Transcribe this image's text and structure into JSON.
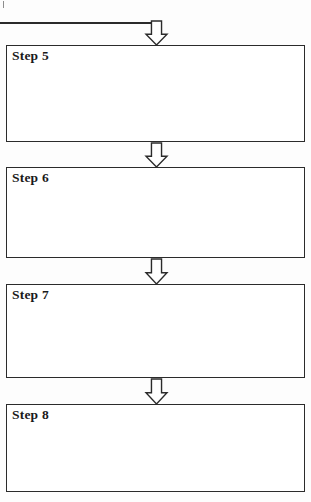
{
  "document": {
    "title": "Flowchart Steps 5-8",
    "background_color": "#ffffff",
    "line_color": "#2b2b2b",
    "text_color": "#1a1a1a"
  },
  "incoming_connector": {
    "name": "incoming-flow-line",
    "description": "horizontal line entering from off-page left",
    "x": 0,
    "y": 22,
    "width": 162,
    "thickness": 1.5
  },
  "scan_artifact": {
    "name": "scan-tick-mark",
    "x": 3,
    "y": 1,
    "width": 1,
    "height": 7
  },
  "steps": [
    {
      "id": "step-5",
      "label": "Step 5",
      "x": 6,
      "y": 45,
      "width": 299,
      "height": 97
    },
    {
      "id": "step-6",
      "label": "Step 6",
      "x": 6,
      "y": 167,
      "width": 299,
      "height": 91
    },
    {
      "id": "step-7",
      "label": "Step 7",
      "x": 6,
      "y": 284,
      "width": 299,
      "height": 94
    },
    {
      "id": "step-8",
      "label": "Step 8",
      "x": 6,
      "y": 404,
      "width": 299,
      "height": 88
    }
  ],
  "arrows": [
    {
      "id": "arrow-into-step-5",
      "name": "arrow-down-into-step-5",
      "from": "",
      "to": "Step 5",
      "x": 146,
      "y": 21,
      "width": 21,
      "height": 24
    },
    {
      "id": "arrow-step-5-to-6",
      "name": "arrow-down-step-5-to-step-6",
      "from": "Step 5",
      "to": "Step 6",
      "x": 146,
      "y": 143,
      "width": 21,
      "height": 24
    },
    {
      "id": "arrow-step-6-to-7",
      "name": "arrow-down-step-6-to-step-7",
      "from": "Step 6",
      "to": "Step 7",
      "x": 146,
      "y": 259,
      "width": 21,
      "height": 25
    },
    {
      "id": "arrow-step-7-to-8",
      "name": "arrow-down-step-7-to-step-8",
      "from": "Step 7",
      "to": "Step 8",
      "x": 146,
      "y": 379,
      "width": 21,
      "height": 25
    }
  ],
  "arrow_shape": {
    "name": "hollow-block-down-arrow",
    "shaft_width_ratio": 0.48,
    "head_height_ratio": 0.45
  }
}
